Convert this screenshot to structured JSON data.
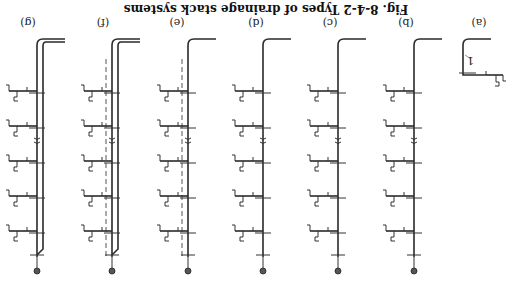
{
  "figure": {
    "orientation": "rotated-180",
    "caption": "Fig. 8-4-2  Types of drainage stack systems",
    "panels": [
      {
        "id": "a",
        "label": "(a)",
        "description": "single stack, one branch shown",
        "callouts": [
          "1"
        ]
      },
      {
        "id": "b",
        "label": "(b)",
        "description": "single stack with multiple floor branches",
        "callouts": [
          "1"
        ]
      },
      {
        "id": "c",
        "label": "(c)",
        "description": "stack with special fittings",
        "callouts": [
          "1",
          "5",
          "6"
        ]
      },
      {
        "id": "d",
        "label": "(d)",
        "description": "stack with fixtures and traps",
        "callouts": [
          "1",
          "7"
        ]
      },
      {
        "id": "e",
        "label": "(e)",
        "description": "stack with auxiliary dashed vent",
        "callouts": [
          "1",
          "4"
        ]
      },
      {
        "id": "f",
        "label": "(f)",
        "description": "double stack with vent connections",
        "callouts": [
          "2",
          "3",
          "4",
          "8"
        ]
      },
      {
        "id": "g",
        "label": "(g)",
        "description": "double stack with vent",
        "callouts": [
          "2",
          "3",
          "8"
        ]
      }
    ]
  }
}
